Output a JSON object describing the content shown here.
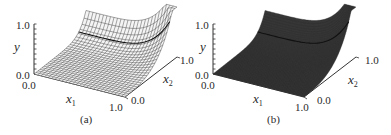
{
  "figure": {
    "panels": [
      {
        "id": "a",
        "caption": "(a)",
        "render_style": "wireframe mesh",
        "axes": {
          "y": {
            "label": "y",
            "tick_min": "0.0",
            "tick_max": "1.0"
          },
          "x1": {
            "label": "x",
            "sub": "1",
            "tick_min": "0.0",
            "tick_max": "1.0"
          },
          "x2": {
            "label": "x",
            "sub": "2",
            "tick_min": "0.0",
            "tick_max": "1.0"
          }
        }
      },
      {
        "id": "b",
        "caption": "(b)",
        "render_style": "dense mesh",
        "axes": {
          "y": {
            "label": "y",
            "tick_min": "0.0",
            "tick_max": "1.0"
          },
          "x1": {
            "label": "x",
            "sub": "1",
            "tick_min": "0.0",
            "tick_max": "1.0"
          },
          "x2": {
            "label": "x",
            "sub": "2",
            "tick_min": "0.0",
            "tick_max": "1.0"
          }
        }
      }
    ]
  },
  "colors": {
    "mesh_a": "#3a3a3a",
    "mesh_b": "#2b2b2b",
    "axis": "#333333",
    "background": "#ffffff"
  },
  "chart_data": [
    {
      "type": "surface",
      "title": "(a)",
      "xlabel": "x1",
      "ylabel": "x2",
      "zlabel": "y",
      "x_range": [
        0.0,
        1.0
      ],
      "y_range": [
        0.0,
        1.0
      ],
      "z_range": [
        0.0,
        1.0
      ],
      "description": "3D wireframe surface y(x1,x2): near 0 over most of the domain, rising steeply toward 1.0 at x1=0 edge and near corner x1=1, x2=1",
      "grid": "coarse wireframe (~25x25)"
    },
    {
      "type": "surface",
      "title": "(b)",
      "xlabel": "x1",
      "ylabel": "x2",
      "zlabel": "y",
      "x_range": [
        0.0,
        1.0
      ],
      "y_range": [
        0.0,
        1.0
      ],
      "z_range": [
        0.0,
        1.0
      ],
      "description": "Same surface rendered with a much finer mesh (appears dark/solid)",
      "grid": "fine mesh"
    }
  ]
}
